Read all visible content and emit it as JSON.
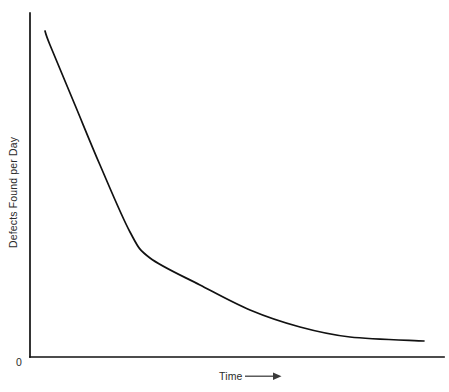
{
  "chart_data": {
    "type": "line",
    "title": "",
    "subtitle": "",
    "xlabel": "Time",
    "ylabel": "Defects Found per Day",
    "xlabel_suffix_icon": "right-arrow-icon",
    "origin_label": "0",
    "grid": false,
    "legend": null,
    "axis_color": "#111111",
    "curve_color": "#111111",
    "background_color": "#ffffff",
    "xlim": [
      0,
      1
    ],
    "ylim": [
      0,
      1
    ],
    "x_tick_labels": [],
    "y_tick_labels": [
      "0"
    ],
    "annotations": [],
    "series": [
      {
        "name": "Defects Found per Day",
        "description": "Exponentially decaying defect discovery rate over time",
        "x": [
          0.036,
          0.048,
          0.109,
          0.169,
          0.242,
          0.29,
          0.411,
          0.531,
          0.652,
          0.773,
          0.952
        ],
        "y": [
          0.947,
          0.907,
          0.732,
          0.558,
          0.363,
          0.288,
          0.209,
          0.137,
          0.087,
          0.058,
          0.046
        ],
        "pixel_points": [
          [
            45,
            31
          ],
          [
            50,
            45
          ],
          [
            75,
            105
          ],
          [
            100,
            165
          ],
          [
            130,
            232
          ],
          [
            150,
            258
          ],
          [
            200,
            285
          ],
          [
            250,
            310
          ],
          [
            300,
            327
          ],
          [
            350,
            337
          ],
          [
            424,
            341
          ]
        ]
      }
    ]
  },
  "figure": {
    "width": 449,
    "height": 392,
    "axes": {
      "y_axis": {
        "x": 30,
        "y_top": 13,
        "y_bottom": 357
      },
      "x_axis": {
        "y": 357,
        "x_left": 30,
        "x_right": 444
      }
    }
  }
}
